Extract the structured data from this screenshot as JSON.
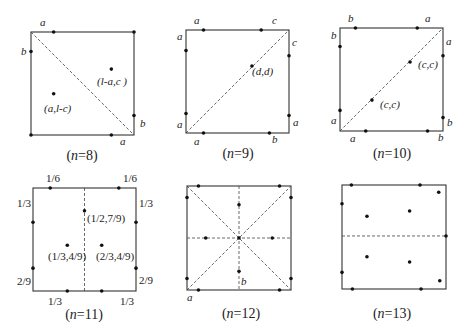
{
  "figure": {
    "panels": [
      {
        "id": "n8",
        "caption": "(n=8)",
        "caption_n": "8",
        "square": {
          "x": 31,
          "y": 32,
          "size": 103
        },
        "dashed": [
          [
            0,
            0,
            1,
            1
          ]
        ],
        "points": [
          [
            0.22,
            0
          ],
          [
            1,
            0
          ],
          [
            0,
            0.19
          ],
          [
            1,
            0.81
          ],
          [
            0,
            1
          ],
          [
            0.78,
            1
          ],
          [
            0.22,
            0.6
          ],
          [
            0.78,
            0.36
          ]
        ],
        "labels": [
          {
            "text": "a",
            "x": 40,
            "y": 26,
            "italic": true
          },
          {
            "text": "b",
            "x": 21,
            "y": 55,
            "italic": true
          },
          {
            "text": "(l-a,c )",
            "x": 97,
            "y": 85,
            "italic": true
          },
          {
            "text": "(a,l-c)",
            "x": 44,
            "y": 112,
            "italic": true
          },
          {
            "text": "b",
            "x": 140,
            "y": 127,
            "italic": true
          },
          {
            "text": "a",
            "x": 120,
            "y": 145,
            "italic": true
          }
        ]
      },
      {
        "id": "n9",
        "caption": "(n=9)",
        "caption_n": "9",
        "square": {
          "x": 186,
          "y": 30,
          "size": 103
        },
        "dashed": [
          [
            0,
            1,
            1,
            0
          ]
        ],
        "points": [
          [
            0.17,
            0
          ],
          [
            0.73,
            0
          ],
          [
            0,
            0.2
          ],
          [
            1,
            0.25
          ],
          [
            0.64,
            0.35
          ],
          [
            0,
            0.81
          ],
          [
            1,
            0.83
          ],
          [
            0.17,
            1
          ],
          [
            0.81,
            1
          ]
        ],
        "labels": [
          {
            "text": "a",
            "x": 194,
            "y": 24,
            "italic": true
          },
          {
            "text": "c",
            "x": 272,
            "y": 24,
            "italic": true
          },
          {
            "text": "a",
            "x": 177,
            "y": 40,
            "italic": true
          },
          {
            "text": "c",
            "x": 292,
            "y": 46,
            "italic": true
          },
          {
            "text": "(d,d)",
            "x": 252,
            "y": 75,
            "italic": true
          },
          {
            "text": "a",
            "x": 177,
            "y": 128,
            "italic": true
          },
          {
            "text": "a",
            "x": 293,
            "y": 126,
            "italic": true
          },
          {
            "text": "a",
            "x": 194,
            "y": 145,
            "italic": true
          },
          {
            "text": "b",
            "x": 272,
            "y": 143,
            "italic": true
          }
        ]
      },
      {
        "id": "n10",
        "caption": "(n=10)",
        "caption_n": "10",
        "square": {
          "x": 340,
          "y": 28,
          "size": 103
        },
        "dashed": [
          [
            0,
            1,
            1,
            0
          ]
        ],
        "points": [
          [
            0.15,
            0
          ],
          [
            0.75,
            0
          ],
          [
            0,
            0.18
          ],
          [
            1,
            0.27
          ],
          [
            0.68,
            0.33
          ],
          [
            0.31,
            0.7
          ],
          [
            0,
            0.8
          ],
          [
            1,
            0.87
          ],
          [
            0.25,
            1
          ],
          [
            0.85,
            1
          ]
        ],
        "labels": [
          {
            "text": "b",
            "x": 348,
            "y": 22,
            "italic": true
          },
          {
            "text": "a",
            "x": 425,
            "y": 22,
            "italic": true
          },
          {
            "text": "b",
            "x": 331,
            "y": 39,
            "italic": true
          },
          {
            "text": "a",
            "x": 446,
            "y": 45,
            "italic": true
          },
          {
            "text": "(c,c)",
            "x": 418,
            "y": 68,
            "italic": true
          },
          {
            "text": "(c,c)",
            "x": 380,
            "y": 108,
            "italic": true
          },
          {
            "text": "a",
            "x": 331,
            "y": 124,
            "italic": true
          },
          {
            "text": "b",
            "x": 447,
            "y": 126,
            "italic": true
          },
          {
            "text": "a",
            "x": 350,
            "y": 142,
            "italic": true
          },
          {
            "text": "b",
            "x": 438,
            "y": 141,
            "italic": true
          }
        ]
      },
      {
        "id": "n11",
        "caption": "(n=11)",
        "caption_n": "11",
        "square": {
          "x": 33,
          "y": 188,
          "size": 103
        },
        "dashed": [
          [
            0.5,
            0,
            0.5,
            1
          ]
        ],
        "points": [
          [
            0.167,
            0
          ],
          [
            0.833,
            0
          ],
          [
            0,
            0.333
          ],
          [
            1,
            0.333
          ],
          [
            0.5,
            0.222
          ],
          [
            0.333,
            0.556
          ],
          [
            0.667,
            0.556
          ],
          [
            0,
            0.778
          ],
          [
            1,
            0.778
          ],
          [
            0.333,
            1
          ],
          [
            0.667,
            1
          ]
        ],
        "labels": [
          {
            "text": "1/6",
            "x": 46,
            "y": 182,
            "italic": false
          },
          {
            "text": "1/6",
            "x": 123,
            "y": 182,
            "italic": false
          },
          {
            "text": "1/3",
            "x": 17,
            "y": 207,
            "italic": false
          },
          {
            "text": "1/3",
            "x": 139,
            "y": 207,
            "italic": false
          },
          {
            "text": "(1/2,7/9)",
            "x": 87,
            "y": 222,
            "italic": false
          },
          {
            "text": "(1/3,4/9)",
            "x": 48,
            "y": 260,
            "italic": false
          },
          {
            "text": "(2/3,4/9)",
            "x": 96,
            "y": 260,
            "italic": false
          },
          {
            "text": "2/9",
            "x": 17,
            "y": 285,
            "italic": false
          },
          {
            "text": "2/9",
            "x": 139,
            "y": 284,
            "italic": false
          },
          {
            "text": "1/3",
            "x": 48,
            "y": 305,
            "italic": false
          },
          {
            "text": "1/3",
            "x": 120,
            "y": 305,
            "italic": false
          }
        ]
      },
      {
        "id": "n12",
        "caption": "(n=12)",
        "caption_n": "12",
        "square": {
          "x": 187,
          "y": 186,
          "size": 104
        },
        "dashed": [
          [
            0,
            0,
            1,
            1
          ],
          [
            0,
            1,
            1,
            0
          ],
          [
            0.5,
            0,
            0.5,
            1
          ],
          [
            0,
            0.5,
            1,
            0.5
          ]
        ],
        "points": [
          [
            0.11,
            0
          ],
          [
            0.89,
            0
          ],
          [
            0,
            0.11
          ],
          [
            1,
            0.11
          ],
          [
            0.5,
            0.18
          ],
          [
            0.18,
            0.5
          ],
          [
            0.5,
            0.5
          ],
          [
            0.82,
            0.5
          ],
          [
            0.5,
            0.82
          ],
          [
            0,
            0.89
          ],
          [
            1,
            0.89
          ],
          [
            0.11,
            1
          ],
          [
            0.89,
            1
          ]
        ],
        "labels": [
          {
            "text": "b",
            "x": 241,
            "y": 285,
            "italic": true
          },
          {
            "text": "a",
            "x": 187,
            "y": 301,
            "italic": true
          }
        ]
      },
      {
        "id": "n13",
        "caption": "(n=13)",
        "caption_n": "13",
        "square": {
          "x": 342,
          "y": 185,
          "size": 104
        },
        "dashed": [
          [
            0,
            0.49,
            1,
            0.49
          ]
        ],
        "points": [
          [
            0.09,
            0
          ],
          [
            0.75,
            0
          ],
          [
            0.93,
            0.07
          ],
          [
            0,
            0.18
          ],
          [
            0.65,
            0.25
          ],
          [
            0.24,
            0.3
          ],
          [
            1,
            0.49
          ],
          [
            0.24,
            0.69
          ],
          [
            0.65,
            0.74
          ],
          [
            0,
            0.84
          ],
          [
            0.94,
            0.92
          ],
          [
            0.1,
            1
          ],
          [
            0.76,
            1
          ]
        ],
        "labels": []
      }
    ],
    "caption_positions": [
      {
        "x": 82,
        "y": 160
      },
      {
        "x": 238,
        "y": 158
      },
      {
        "x": 392,
        "y": 158
      },
      {
        "x": 84,
        "y": 319
      },
      {
        "x": 241,
        "y": 318
      },
      {
        "x": 392,
        "y": 318
      }
    ]
  }
}
